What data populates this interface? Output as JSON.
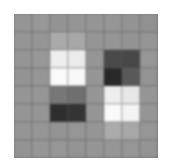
{
  "figure": {
    "background_color": "#ffffff",
    "plot_background_color": "#9a9a9a",
    "grid_line_color": "#5a5a5a"
  },
  "chart_data": {
    "type": "heatmap",
    "title": "",
    "subtitle": "",
    "xlabel": "",
    "ylabel": "",
    "grid": true,
    "legend": null,
    "colormap": "gray",
    "rows": 8,
    "cols": 8,
    "x": [
      0,
      1,
      2,
      3,
      4,
      5,
      6,
      7
    ],
    "y": [
      0,
      1,
      2,
      3,
      4,
      5,
      6,
      7
    ],
    "xticklabels": [],
    "yticklabels": [],
    "vmin": 0,
    "vmax": 255,
    "annotations": [],
    "values": [
      [
        150,
        152,
        148,
        150,
        150,
        150,
        148,
        146
      ],
      [
        150,
        150,
        170,
        168,
        150,
        150,
        148,
        150
      ],
      [
        150,
        152,
        238,
        236,
        150,
        74,
        72,
        150
      ],
      [
        148,
        150,
        250,
        248,
        150,
        40,
        90,
        148
      ],
      [
        150,
        150,
        120,
        112,
        150,
        238,
        232,
        150
      ],
      [
        150,
        150,
        46,
        52,
        150,
        250,
        244,
        150
      ],
      [
        150,
        150,
        148,
        150,
        150,
        172,
        168,
        150
      ],
      [
        148,
        150,
        150,
        148,
        150,
        150,
        150,
        148
      ]
    ],
    "cell_colors": [
      [
        "#969696",
        "#989898",
        "#949494",
        "#969696",
        "#969696",
        "#969696",
        "#949494",
        "#929292"
      ],
      [
        "#969696",
        "#969696",
        "#aaaaaa",
        "#a8a8a8",
        "#969696",
        "#969696",
        "#949494",
        "#969696"
      ],
      [
        "#969696",
        "#989898",
        "#eeeeee",
        "#ececec",
        "#969696",
        "#4a4a4a",
        "#484848",
        "#969696"
      ],
      [
        "#949494",
        "#969696",
        "#fafafa",
        "#f8f8f8",
        "#969696",
        "#282828",
        "#5a5a5a",
        "#949494"
      ],
      [
        "#969696",
        "#969696",
        "#787878",
        "#707070",
        "#969696",
        "#eeeeee",
        "#e8e8e8",
        "#969696"
      ],
      [
        "#969696",
        "#969696",
        "#2e2e2e",
        "#343434",
        "#969696",
        "#fafafa",
        "#f4f4f4",
        "#969696"
      ],
      [
        "#969696",
        "#969696",
        "#949494",
        "#969696",
        "#969696",
        "#acacac",
        "#a8a8a8",
        "#969696"
      ],
      [
        "#949494",
        "#969696",
        "#969696",
        "#949494",
        "#969696",
        "#969696",
        "#969696",
        "#949494"
      ]
    ]
  }
}
